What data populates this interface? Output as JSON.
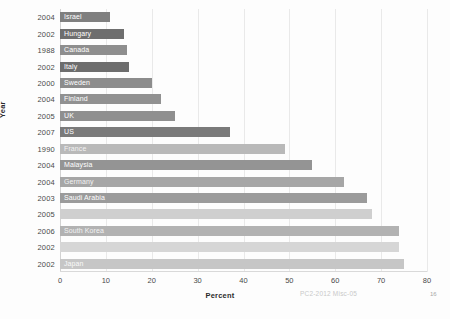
{
  "chart_data": {
    "type": "bar",
    "orientation": "horizontal",
    "title": "",
    "xlabel": "Percent",
    "ylabel": "Year",
    "xlim": [
      0,
      80
    ],
    "xticks": [
      0,
      10,
      20,
      30,
      40,
      50,
      60,
      70,
      80
    ],
    "grid": true,
    "legend": "none",
    "categories": [
      "2004",
      "2002",
      "1988",
      "2002",
      "2000",
      "2004",
      "2005",
      "2007",
      "1990",
      "2004",
      "2004",
      "2003",
      "2005",
      "2006",
      "2002",
      "2002"
    ],
    "bar_labels": [
      "Israel",
      "Hungary",
      "Canada",
      "Italy",
      "Sweden",
      "Finland",
      "UK",
      "US",
      "France",
      "Malaysia",
      "Germany",
      "Saudi Arabia",
      "",
      "South Korea",
      "",
      "Japan"
    ],
    "values": [
      11,
      14,
      14.5,
      15,
      20,
      22,
      25,
      37,
      49,
      55,
      62,
      67,
      68,
      74,
      74,
      75
    ],
    "bar_colors": [
      "#7f7f7f",
      "#6e6e6e",
      "#8e8e8e",
      "#6d6d6d",
      "#8c8c8c",
      "#919191",
      "#8f8f8f",
      "#7a7a7a",
      "#b9b9b9",
      "#949494",
      "#a6a6a6",
      "#9b9b9b",
      "#cfcfcf",
      "#b2b2b2",
      "#d6d6d6",
      "#c6c6c6"
    ]
  },
  "footer": {
    "watermark": "PC2-2012 Misc-05",
    "page_number": "16"
  }
}
